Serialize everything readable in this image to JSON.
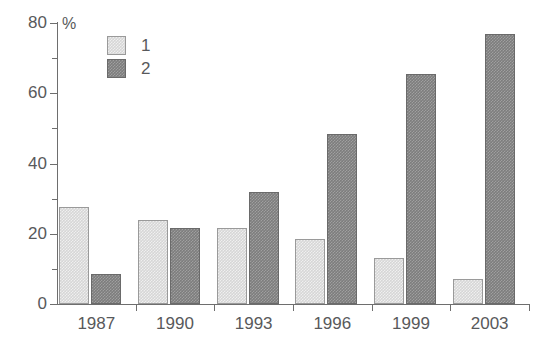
{
  "chart_data": {
    "type": "bar",
    "title": "",
    "subtitle": "",
    "xlabel": "",
    "ylabel": "%",
    "unit_label": "%",
    "categories": [
      "1987",
      "1990",
      "1993",
      "1996",
      "1999",
      "2003"
    ],
    "series": [
      {
        "name": "1",
        "color": "#d6d6d6",
        "values": [
          27.5,
          24.0,
          21.5,
          18.5,
          13.0,
          7.0
        ]
      },
      {
        "name": "2",
        "color": "#7d7d7d",
        "values": [
          8.5,
          21.5,
          32.0,
          48.5,
          65.5,
          77.0
        ]
      }
    ],
    "ylim": [
      0,
      80
    ],
    "yticks": [
      0,
      20,
      40,
      60,
      80
    ],
    "ytick_labels": [
      "0",
      "20",
      "40",
      "60",
      "80"
    ],
    "yticks_minor": [
      10,
      30,
      50,
      70
    ],
    "grid": false,
    "legend_position": "top-left",
    "legend_entries": [
      {
        "label": "1",
        "color": "#d6d6d6"
      },
      {
        "label": "2",
        "color": "#7d7d7d"
      }
    ],
    "axis_color": "#6e6e6e",
    "text_color": "#58595b",
    "background": "#ffffff"
  }
}
